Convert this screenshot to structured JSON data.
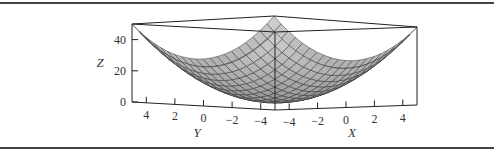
{
  "chart_data": {
    "type": "surface3d",
    "title": "",
    "function": "z = x^2 + y^2",
    "x": {
      "label": "X",
      "range": [
        -5,
        5
      ],
      "ticks": [
        -4,
        -2,
        0,
        2,
        4
      ],
      "tick_labels": [
        "−4",
        "−2",
        "0",
        "2",
        "4"
      ]
    },
    "y": {
      "label": "Y",
      "range": [
        -5,
        5
      ],
      "ticks": [
        4,
        2,
        0,
        -2,
        -4
      ],
      "tick_labels": [
        "4",
        "2",
        "0",
        "−2",
        "−4"
      ]
    },
    "z": {
      "label": "Z",
      "range": [
        0,
        50
      ],
      "ticks": [
        0,
        20,
        40
      ],
      "tick_labels": [
        "0",
        "20",
        "40"
      ]
    },
    "grid_divisions": 20,
    "colors": {
      "surface": "#c8c8c8",
      "mesh": "#3a3a3a",
      "frame": "#222222",
      "border": "#444444"
    }
  }
}
